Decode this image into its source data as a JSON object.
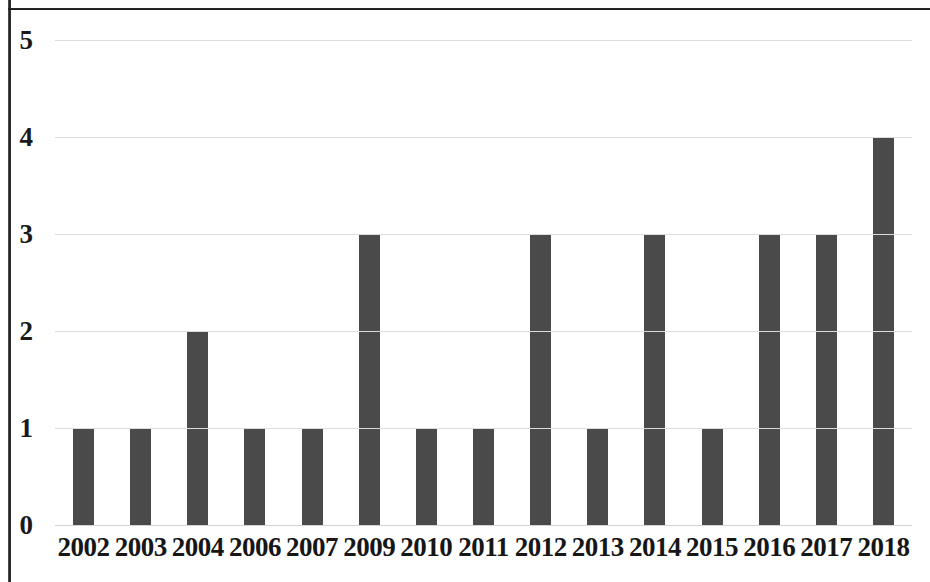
{
  "figure": {
    "background_color": "#ffffff",
    "frame_color": "#1c1c1c",
    "bar_color": "#4a4a4a",
    "gridline_color": "#dcdcdc",
    "axis_text_color": "#161616"
  },
  "chart_data": {
    "type": "bar",
    "title": "",
    "subtitle": "",
    "xlabel": "",
    "ylabel": "",
    "categories": [
      "2002",
      "2003",
      "2004",
      "2006",
      "2007",
      "2009",
      "2010",
      "2011",
      "2012",
      "2013",
      "2014",
      "2015",
      "2016",
      "2017",
      "2018"
    ],
    "values": [
      1,
      1,
      2,
      1,
      1,
      3,
      1,
      1,
      3,
      1,
      3,
      1,
      3,
      3,
      4
    ],
    "series": [
      {
        "name": "",
        "values": [
          1,
          1,
          2,
          1,
          1,
          3,
          1,
          1,
          3,
          1,
          3,
          1,
          3,
          3,
          4
        ]
      }
    ],
    "ylim": [
      0,
      5
    ],
    "xlim": [
      0,
      15
    ],
    "y_ticks": [
      0,
      1,
      2,
      3,
      4,
      5
    ],
    "y_tick_labels": [
      "0",
      "1",
      "2",
      "3",
      "4",
      "5"
    ],
    "grid": true,
    "grid_axis": "y",
    "legend": false,
    "legend_position": "none",
    "annotations": [],
    "data_labels": false
  }
}
